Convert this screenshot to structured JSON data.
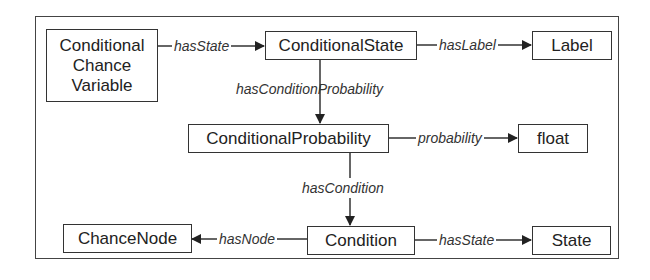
{
  "diagram": {
    "nodes": {
      "ccv": {
        "label_lines": [
          "Conditional",
          "Chance",
          "Variable"
        ]
      },
      "conditional_state": {
        "label": "ConditionalState"
      },
      "label": {
        "label": "Label"
      },
      "conditional_probability": {
        "label": "ConditionalProbability"
      },
      "float": {
        "label": "float"
      },
      "condition": {
        "label": "Condition"
      },
      "chance_node": {
        "label": "ChanceNode"
      },
      "state": {
        "label": "State"
      }
    },
    "edges": [
      {
        "from": "Conditional Chance Variable",
        "to": "ConditionalState",
        "label": "hasState"
      },
      {
        "from": "ConditionalState",
        "to": "Label",
        "label": "hasLabel"
      },
      {
        "from": "ConditionalState",
        "to": "ConditionalProbability",
        "label": "hasConditionProbability"
      },
      {
        "from": "ConditionalProbability",
        "to": "float",
        "label": "probability"
      },
      {
        "from": "ConditionalProbability",
        "to": "Condition",
        "label": "hasCondition"
      },
      {
        "from": "Condition",
        "to": "ChanceNode",
        "label": "hasNode"
      },
      {
        "from": "Condition",
        "to": "State",
        "label": "hasState"
      }
    ],
    "edge_labels": {
      "has_state_1": "hasState",
      "has_label": "hasLabel",
      "has_condition_probability": "hasConditionProbability",
      "probability": "probability",
      "has_condition": "hasCondition",
      "has_node": "hasNode",
      "has_state_2": "hasState"
    },
    "colors": {
      "line": "#333333",
      "text": "#222222",
      "background": "#ffffff"
    }
  }
}
